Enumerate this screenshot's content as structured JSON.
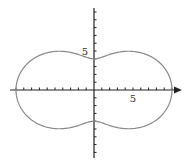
{
  "chart_data": {
    "type": "line",
    "subtype": "polar-curve",
    "title": "",
    "equation": "r = 7 + 3cos(2θ)",
    "xlabel": "",
    "ylabel": "",
    "xlim": [
      -11,
      12
    ],
    "ylim": [
      -9,
      11
    ],
    "x_tick_step": 1,
    "y_tick_step": 1,
    "tick_labels": {
      "x": [
        "5"
      ],
      "y": [
        "5"
      ]
    },
    "grid": false,
    "legend": null,
    "key_points": [
      {
        "x": 10,
        "y": 0
      },
      {
        "x": -10,
        "y": 0
      },
      {
        "x": 0,
        "y": 4
      },
      {
        "x": 0,
        "y": -4
      },
      {
        "x": 5,
        "y": 5
      },
      {
        "x": -5,
        "y": 5
      },
      {
        "x": 5,
        "y": -5
      },
      {
        "x": -5,
        "y": -5
      }
    ],
    "colors": {
      "curve": "#8a8a8a",
      "axes": "#222222"
    }
  },
  "labels": {
    "x5": "5",
    "y5": "5"
  }
}
